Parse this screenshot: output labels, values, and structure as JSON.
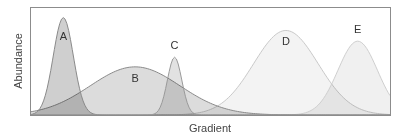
{
  "chart_data": {
    "type": "area",
    "title": "",
    "xlabel": "Gradient",
    "ylabel": "Abundance",
    "grid": false,
    "legend": "none (curves labeled directly)",
    "x_range": [
      0,
      100
    ],
    "y_range": [
      0,
      1
    ],
    "series": [
      {
        "name": "A",
        "peak_x": 9,
        "peak_y": 0.91,
        "width": 2.8,
        "fill": "#cfcfcf",
        "stroke": "#8a8a8a"
      },
      {
        "name": "B",
        "peak_x": 29,
        "peak_y": 0.45,
        "width": 12.5,
        "fill": "#dcdcdc",
        "stroke": "#8a8a8a"
      },
      {
        "name": "C",
        "peak_x": 40,
        "peak_y": 0.54,
        "width": 2.0,
        "fill": "#e2e2e2",
        "stroke": "#9a9a9a"
      },
      {
        "name": "D",
        "peak_x": 71,
        "peak_y": 0.79,
        "width": 9.0,
        "fill": "#f3f3f3",
        "stroke": "#c9c9c9"
      },
      {
        "name": "E",
        "peak_x": 91,
        "peak_y": 0.69,
        "width": 5.5,
        "fill": "#f0f0f0",
        "stroke": "#cfcfcf"
      }
    ]
  },
  "labels": {
    "x_axis": "Gradient",
    "y_axis": "Abundance",
    "curves": [
      "A",
      "B",
      "C",
      "D",
      "E"
    ]
  }
}
